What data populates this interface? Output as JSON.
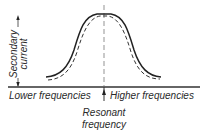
{
  "diagram": {
    "y_axis_label_line1": "Secondary",
    "y_axis_label_line2": "current",
    "x_left_label": "Lower frequencies",
    "x_right_label": "Higher frequencies",
    "center_label_line1": "Resonant",
    "center_label_line2": "frequency",
    "curves": [
      {
        "name": "solid-curve",
        "style": "solid",
        "description": "Higher resonance peak curve"
      },
      {
        "name": "dashed-curve",
        "style": "dashed",
        "description": "Narrower inner curve"
      }
    ],
    "colors": {
      "line": "#222222",
      "background": "#ffffff",
      "text": "#2a2a2a"
    }
  }
}
